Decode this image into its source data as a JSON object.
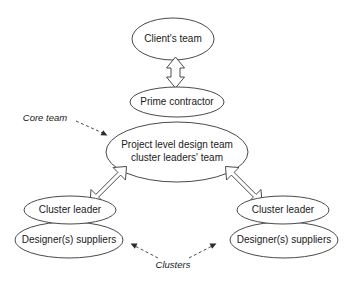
{
  "diagram": {
    "background_color": "#ffffff",
    "stroke_color": "#4a4a4a",
    "text_color": "#1a1a1a",
    "nodes": {
      "client_team": "Client's team",
      "prime_contractor": "Prime contractor",
      "core_team_line1": "Project level design team",
      "core_team_line2": "cluster leaders' team",
      "cluster_leader_left": "Cluster leader",
      "designers_suppliers_left": "Designer(s) suppliers",
      "cluster_leader_right": "Cluster leader",
      "designers_suppliers_right": "Designer(s) suppliers"
    },
    "annotations": {
      "core_team": "Core team",
      "clusters": "Clusters"
    },
    "connectors": {
      "client_to_prime": "double-headed-vertical-arrow",
      "core_to_left_cluster": "double-headed-diagonal-arrow",
      "core_to_right_cluster": "double-headed-diagonal-arrow",
      "core_team_pointer": "dashed-arrow",
      "clusters_pointer_left": "dashed-arrow",
      "clusters_pointer_right": "dashed-arrow"
    }
  }
}
